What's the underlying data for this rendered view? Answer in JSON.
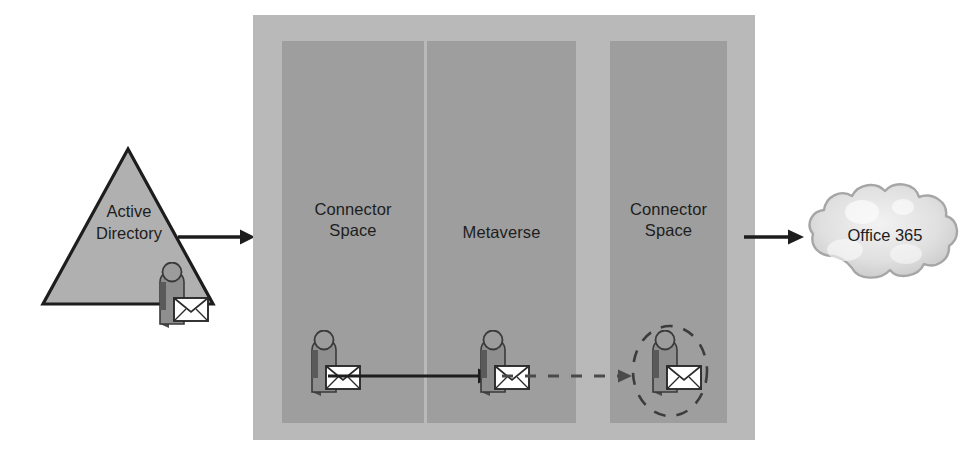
{
  "diagram": {
    "source": {
      "label": "Active\nDirectory",
      "label_line1": "Active",
      "label_line2": "Directory",
      "shape": "triangle",
      "fill_color": "#b0b0b0",
      "stroke_color": "#1d1d1d"
    },
    "destination": {
      "label": "Office 365",
      "shape": "cloud",
      "fill_color": "#d9d9d9",
      "stroke_color": "#9a9a9a"
    },
    "container": {
      "fill_color": "#b9b9b9",
      "column_fill_color": "#9e9e9e",
      "columns": [
        {
          "id": "connector-space-source",
          "label": "Connector\nSpace",
          "label_line1": "Connector",
          "label_line2": "Space"
        },
        {
          "id": "metaverse",
          "label": "Metaverse",
          "label_line1": "Metaverse",
          "label_line2": ""
        },
        {
          "id": "connector-space-target",
          "label": "Connector\nSpace",
          "label_line1": "Connector",
          "label_line2": "Space"
        }
      ]
    },
    "objects": [
      {
        "id": "ad-user",
        "type": "user-with-mail",
        "in": "active-directory",
        "highlighted": false
      },
      {
        "id": "cs-source-user",
        "type": "user-with-mail",
        "in": "connector-space-source",
        "highlighted": false
      },
      {
        "id": "mv-user",
        "type": "user-with-mail",
        "in": "metaverse",
        "highlighted": false
      },
      {
        "id": "cs-target-user",
        "type": "user-with-mail",
        "in": "connector-space-target",
        "highlighted": true
      }
    ],
    "connectors": [
      {
        "id": "ad-to-container",
        "style": "solid",
        "direction": "right"
      },
      {
        "id": "cs-source-to-metaverse",
        "style": "solid",
        "direction": "right"
      },
      {
        "id": "metaverse-to-cs-target",
        "style": "dashed",
        "direction": "right"
      },
      {
        "id": "container-to-office365",
        "style": "solid",
        "direction": "right"
      }
    ],
    "colors": {
      "background": "#ffffff",
      "ink": "#1d1d1d",
      "panel": "#b9b9b9",
      "column": "#9e9e9e"
    }
  }
}
